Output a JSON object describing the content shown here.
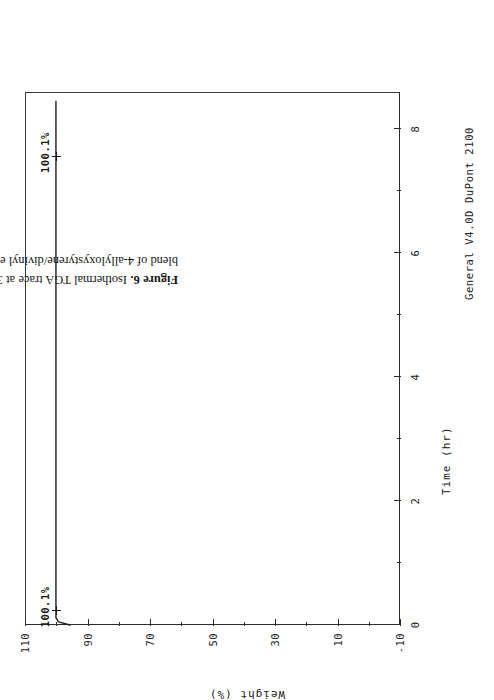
{
  "figure": {
    "caption_label": "Figure 6.",
    "caption_text": " Isothermal TGA trace at 300°C for post-cured 3/1 blend of 4-allyloxystyrene/divinyl ether blend.",
    "instrument_note": "General V4.0D DuPont 2100",
    "page_rotation_deg": -90,
    "ink_color": "#1a1a1a"
  },
  "chart_data": {
    "type": "line",
    "title": "",
    "xlabel": "Time (hr)",
    "ylabel": "Weight (%)",
    "xlim": [
      0,
      8.6
    ],
    "ylim": [
      -10,
      110
    ],
    "xticks": [
      0,
      2,
      4,
      6,
      8
    ],
    "xtick_labels": [
      "0",
      "2",
      "4",
      "6",
      "8"
    ],
    "xticks_minor": [
      1,
      3,
      5,
      7
    ],
    "yticks": [
      -10,
      10,
      30,
      50,
      70,
      90,
      110
    ],
    "ytick_labels": [
      "-10",
      "10",
      "30",
      "50",
      "70",
      "90",
      "110"
    ],
    "yticks_minor": [
      0,
      20,
      40,
      60,
      80,
      100
    ],
    "grid": false,
    "legend": "none",
    "series": [
      {
        "name": "Weight",
        "x": [
          0.0,
          0.05,
          0.12,
          0.25,
          0.5,
          1.0,
          2.0,
          3.0,
          4.0,
          5.0,
          6.0,
          7.0,
          8.0,
          8.45
        ],
        "y": [
          95.6,
          99.3,
          100.1,
          100.1,
          100.1,
          100.1,
          100.1,
          100.1,
          100.1,
          100.1,
          100.1,
          100.1,
          100.1,
          100.1
        ]
      }
    ],
    "annotations": [
      {
        "id": "start-weight",
        "label": "100.1%",
        "x": 0.22,
        "y": 100.1
      },
      {
        "id": "end-weight",
        "label": "100.1%",
        "x": 7.55,
        "y": 100.1
      }
    ]
  }
}
